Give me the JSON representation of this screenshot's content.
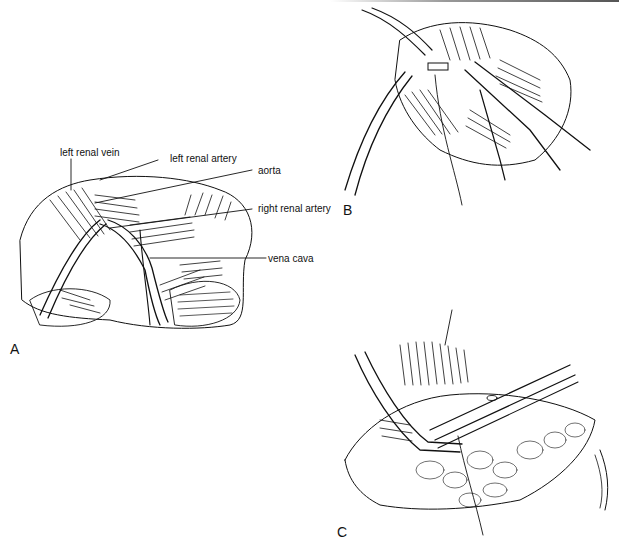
{
  "figure": {
    "panels": [
      {
        "id": "A",
        "label": "A"
      },
      {
        "id": "B",
        "label": "B"
      },
      {
        "id": "C",
        "label": "C"
      }
    ],
    "annotations": {
      "left_renal_vein": "left renal vein",
      "left_renal_artery": "left renal artery",
      "aorta": "aorta",
      "right_renal_artery": "right renal artery",
      "vena_cava": "vena cava"
    },
    "colors": {
      "ink": "#111111",
      "background": "#ffffff"
    }
  }
}
